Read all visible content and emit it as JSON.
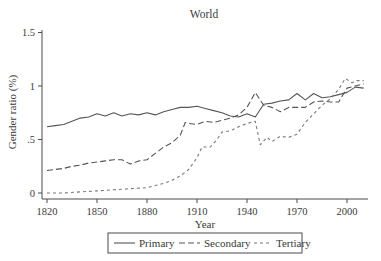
{
  "chart_data": {
    "type": "line",
    "title": "World",
    "xlabel": "Year",
    "ylabel": "Gender ratio (%)",
    "xlim": [
      1820,
      2012
    ],
    "ylim": [
      0,
      1.5
    ],
    "x_ticks": [
      1820,
      1850,
      1880,
      1910,
      1940,
      1970,
      2000
    ],
    "x_tick_labels": [
      "1820",
      "1850",
      "1880",
      "1910",
      "1940",
      "1970",
      "2000"
    ],
    "y_ticks": [
      0,
      0.5,
      1,
      1.5
    ],
    "y_tick_labels": [
      "0",
      ".5",
      "1",
      "1.5"
    ],
    "grid": false,
    "legend_position": "bottom",
    "series": [
      {
        "name": "Primary",
        "style": "solid",
        "x": [
          1820,
          1825,
          1830,
          1835,
          1840,
          1845,
          1850,
          1855,
          1860,
          1865,
          1870,
          1875,
          1880,
          1885,
          1890,
          1895,
          1900,
          1905,
          1910,
          1915,
          1920,
          1925,
          1930,
          1935,
          1940,
          1945,
          1950,
          1955,
          1960,
          1965,
          1970,
          1975,
          1980,
          1985,
          1990,
          1995,
          2000,
          2005,
          2010
        ],
        "values": [
          0.62,
          0.63,
          0.64,
          0.67,
          0.7,
          0.71,
          0.74,
          0.72,
          0.75,
          0.72,
          0.74,
          0.73,
          0.75,
          0.73,
          0.76,
          0.78,
          0.8,
          0.8,
          0.81,
          0.79,
          0.77,
          0.75,
          0.72,
          0.71,
          0.74,
          0.71,
          0.83,
          0.84,
          0.86,
          0.87,
          0.93,
          0.87,
          0.93,
          0.89,
          0.9,
          0.92,
          0.94,
          0.99,
          0.98
        ]
      },
      {
        "name": "Secondary",
        "style": "long-dash",
        "x": [
          1820,
          1825,
          1830,
          1835,
          1840,
          1845,
          1850,
          1855,
          1860,
          1865,
          1870,
          1875,
          1880,
          1885,
          1890,
          1895,
          1900,
          1903,
          1905,
          1910,
          1915,
          1920,
          1925,
          1930,
          1935,
          1940,
          1945,
          1950,
          1955,
          1960,
          1965,
          1970,
          1975,
          1980,
          1985,
          1990,
          1995,
          2000,
          2005,
          2010
        ],
        "values": [
          0.21,
          0.22,
          0.23,
          0.25,
          0.26,
          0.28,
          0.29,
          0.3,
          0.31,
          0.31,
          0.27,
          0.3,
          0.31,
          0.37,
          0.43,
          0.47,
          0.54,
          0.66,
          0.65,
          0.64,
          0.67,
          0.66,
          0.68,
          0.7,
          0.73,
          0.8,
          0.94,
          0.82,
          0.8,
          0.76,
          0.8,
          0.8,
          0.8,
          0.85,
          0.86,
          0.85,
          0.85,
          0.98,
          1.0,
          1.02
        ]
      },
      {
        "name": "Tertiary",
        "style": "short-dash",
        "x": [
          1820,
          1830,
          1840,
          1850,
          1860,
          1870,
          1880,
          1885,
          1890,
          1895,
          1900,
          1905,
          1910,
          1913,
          1918,
          1922,
          1925,
          1930,
          1935,
          1940,
          1945,
          1948,
          1952,
          1955,
          1960,
          1965,
          1970,
          1975,
          1980,
          1985,
          1990,
          1995,
          1999,
          2003,
          2006,
          2010
        ],
        "values": [
          0.0,
          0.0,
          0.01,
          0.02,
          0.03,
          0.04,
          0.05,
          0.07,
          0.09,
          0.12,
          0.16,
          0.22,
          0.33,
          0.43,
          0.43,
          0.5,
          0.57,
          0.58,
          0.62,
          0.65,
          0.67,
          0.45,
          0.52,
          0.48,
          0.53,
          0.52,
          0.55,
          0.66,
          0.74,
          0.82,
          0.88,
          0.97,
          1.07,
          1.03,
          1.05,
          1.05
        ]
      }
    ]
  },
  "legend": {
    "items": [
      {
        "label": "Primary",
        "style": "solid"
      },
      {
        "label": "Secondary",
        "style": "long-dash"
      },
      {
        "label": "Tertiary",
        "style": "short-dash"
      }
    ]
  },
  "colors": {
    "axis": "#4a4a4a",
    "line": "#555555",
    "text": "#3a3a3a"
  }
}
